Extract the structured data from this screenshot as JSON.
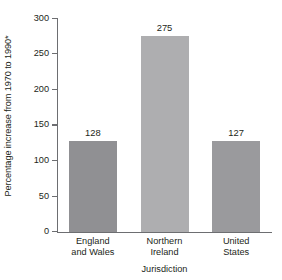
{
  "chart_data": {
    "type": "bar",
    "title": "",
    "subtitle": "",
    "xlabel": "Jurisdiction",
    "ylabel": "Percentage increase from 1970 to 1990*",
    "categories": [
      "England and Wales",
      "Northern Ireland",
      "United States"
    ],
    "category_lines": [
      [
        "England",
        "and Wales"
      ],
      [
        "Northern",
        "Ireland"
      ],
      [
        "United",
        "States"
      ]
    ],
    "values": [
      128,
      275,
      127
    ],
    "value_labels": [
      "128",
      "275",
      "127"
    ],
    "ylim": [
      0,
      300
    ],
    "y_ticks": [
      300,
      250,
      200,
      150,
      100,
      50,
      0
    ],
    "y_tick_labels": [
      "300",
      "250",
      "200",
      "150",
      "100",
      "50",
      "0"
    ],
    "grid": false,
    "legend": false,
    "legend_position": "none",
    "bar_colors": [
      "#909093",
      "#aeaeb0",
      "#9a9a9d"
    ],
    "axis_color": "#6d6e71",
    "text_color": "#231f20",
    "background": "#ffffff"
  }
}
